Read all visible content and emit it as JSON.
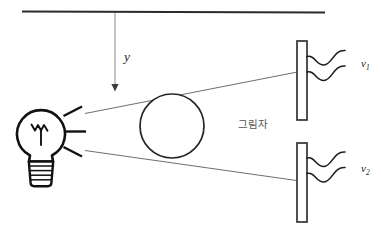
{
  "figure": {
    "type": "physics-optics-shadow-diagram",
    "background_color": "#ffffff",
    "stroke_color": "#1a1a1a",
    "thin_stroke_color": "#5a5a5a",
    "labels": {
      "distance_y": "y",
      "shadow_ko": "그림자",
      "velocity_top": "v",
      "velocity_top_sub": "1",
      "velocity_bottom": "v",
      "velocity_bottom_sub": "2"
    },
    "elements": {
      "ceiling_line": {
        "name": "ceiling-rail",
        "x1": 22,
        "y1": 11,
        "x2": 325,
        "y2": 12
      },
      "drop_arrow": {
        "name": "y-drop-arrow",
        "x": 115,
        "y_start": 12,
        "y_end": 90,
        "label": "y",
        "label_x": 124,
        "label_y": 60
      },
      "bulb": {
        "name": "light-bulb",
        "center_x": 41,
        "center_y": 132,
        "glass_radius": 24,
        "base_top_y": 160,
        "base_bottom_y": 186,
        "base_half_width_top": 13,
        "base_half_width_bottom": 11,
        "base_ring_count": 4
      },
      "light_rays": {
        "name": "bulb-light-rays",
        "count": 3,
        "segments": [
          {
            "x1": 64,
            "y1": 115,
            "x2": 82,
            "y2": 107
          },
          {
            "x1": 66,
            "y1": 131,
            "x2": 86,
            "y2": 131
          },
          {
            "x1": 64,
            "y1": 148,
            "x2": 82,
            "y2": 156
          }
        ]
      },
      "ball": {
        "name": "occluding-sphere",
        "cx": 172,
        "cy": 126,
        "r": 32
      },
      "shadow_rays": {
        "name": "shadow-boundary-rays",
        "upper": {
          "x1": 85,
          "y1": 113,
          "x2": 300,
          "y2": 72
        },
        "lower": {
          "x1": 85,
          "y1": 151,
          "x2": 300,
          "y2": 181
        }
      },
      "screen_top": {
        "name": "screen-top",
        "x": 297,
        "y": 41,
        "width": 10,
        "height": 79
      },
      "screen_bottom": {
        "name": "screen-bottom",
        "x": 297,
        "y": 143,
        "width": 10,
        "height": 79
      },
      "waves_top": {
        "name": "wave-lines-top",
        "y_first": 57,
        "y_second": 72
      },
      "waves_bottom": {
        "name": "wave-lines-bottom",
        "y_first": 158,
        "y_second": 173
      },
      "shadow_label": {
        "name": "shadow-region-label",
        "x": 238,
        "y": 128
      },
      "v1_label": {
        "name": "v1-label",
        "x": 364,
        "y": 67
      },
      "v2_label": {
        "name": "v2-label",
        "x": 364,
        "y": 172
      }
    }
  }
}
